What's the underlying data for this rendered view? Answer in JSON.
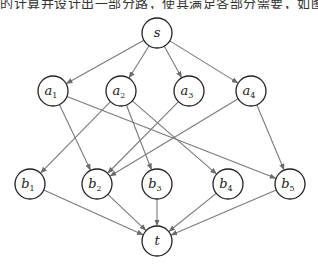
{
  "caption": {
    "text": "的计算并设计出一部分路，使其满足各部分需要，如图 6-20 所示。",
    "clipped": true
  },
  "colors": {
    "edge": "#7a7a7a",
    "node_stroke": "#222222",
    "background": "#ffffff"
  },
  "graph": {
    "directed": true,
    "nodes": [
      {
        "id": "s",
        "label": "s",
        "sub": "",
        "x": 157,
        "y": 33,
        "r": 15
      },
      {
        "id": "a1",
        "label": "a",
        "sub": "1",
        "x": 53,
        "y": 91,
        "r": 15
      },
      {
        "id": "a2",
        "label": "a",
        "sub": "2",
        "x": 121,
        "y": 91,
        "r": 15
      },
      {
        "id": "a3",
        "label": "a",
        "sub": "3",
        "x": 189,
        "y": 91,
        "r": 15
      },
      {
        "id": "a4",
        "label": "a",
        "sub": "4",
        "x": 251,
        "y": 91,
        "r": 15
      },
      {
        "id": "b1",
        "label": "b",
        "sub": "1",
        "x": 30,
        "y": 184,
        "r": 15
      },
      {
        "id": "b2",
        "label": "b",
        "sub": "2",
        "x": 97,
        "y": 184,
        "r": 15
      },
      {
        "id": "b3",
        "label": "b",
        "sub": "3",
        "x": 157,
        "y": 184,
        "r": 15
      },
      {
        "id": "b4",
        "label": "b",
        "sub": "4",
        "x": 228,
        "y": 184,
        "r": 15
      },
      {
        "id": "b5",
        "label": "b",
        "sub": "5",
        "x": 290,
        "y": 184,
        "r": 15
      },
      {
        "id": "t",
        "label": "t",
        "sub": "",
        "x": 157,
        "y": 241,
        "r": 15
      }
    ],
    "edges": [
      {
        "from": "s",
        "to": "a1"
      },
      {
        "from": "s",
        "to": "a2"
      },
      {
        "from": "s",
        "to": "a3"
      },
      {
        "from": "s",
        "to": "a4"
      },
      {
        "from": "a1",
        "to": "b2"
      },
      {
        "from": "a1",
        "to": "b5"
      },
      {
        "from": "a2",
        "to": "b1"
      },
      {
        "from": "a2",
        "to": "b3"
      },
      {
        "from": "a2",
        "to": "b4"
      },
      {
        "from": "a3",
        "to": "b2"
      },
      {
        "from": "a4",
        "to": "b2"
      },
      {
        "from": "a4",
        "to": "b5"
      },
      {
        "from": "b1",
        "to": "t"
      },
      {
        "from": "b2",
        "to": "t"
      },
      {
        "from": "b3",
        "to": "t"
      },
      {
        "from": "b4",
        "to": "t"
      },
      {
        "from": "b5",
        "to": "t"
      }
    ]
  }
}
